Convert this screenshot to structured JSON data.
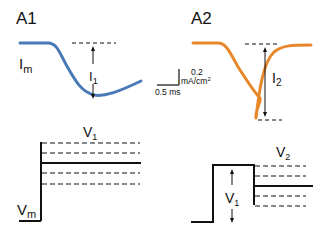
{
  "panels": {
    "a1": {
      "title": "A1",
      "current_label": "I",
      "current_sub": "m",
      "amplitude_label": "I",
      "amplitude_sub": "1",
      "voltage_label": "V",
      "voltage_sub": "m",
      "step_label": "V",
      "step_sub": "1",
      "trace_color": "#4a7ab5"
    },
    "a2": {
      "title": "A2",
      "amplitude_label": "I",
      "amplitude_sub": "2",
      "step1_label": "V",
      "step1_sub": "1",
      "step2_label": "V",
      "step2_sub": "2",
      "trace_color": "#e8862a"
    }
  },
  "scale_bar": {
    "vertical_value": "0.2",
    "vertical_unit": "mA/cm",
    "vertical_unit_sup": "2",
    "horizontal_label": "0.5 ms"
  }
}
